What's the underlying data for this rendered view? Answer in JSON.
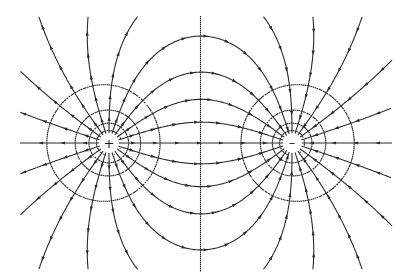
{
  "diagram": {
    "width": 408,
    "height": 275,
    "line_color": "#2a2a2a",
    "background": "#ffffff",
    "charges": [
      {
        "name": "positive-charge",
        "sign": "+",
        "label": "+",
        "x": 109,
        "y": 143,
        "q": 1
      },
      {
        "name": "negative-charge",
        "sign": "-",
        "label": "–",
        "x": 292,
        "y": 143,
        "q": -1
      }
    ],
    "field_lines": {
      "count": 20,
      "start_radius": 10,
      "clip": {
        "xmin": 20,
        "xmax": 392,
        "ymin": 16,
        "ymax": 270
      },
      "style": "solid",
      "arrow_direction": "from + to -"
    },
    "equipotentials": {
      "style": "dashed",
      "levels": [
        0.075,
        0.045,
        0.025,
        0.012,
        0.0,
        -0.012,
        -0.025,
        -0.045,
        -0.075
      ]
    },
    "legend": []
  }
}
